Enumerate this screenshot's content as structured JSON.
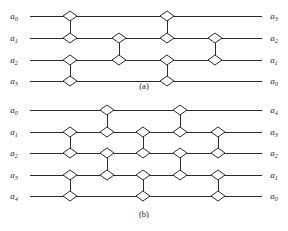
{
  "figure": {
    "background_color": "#ffffff",
    "line_color": "#2b2b2b",
    "node_fill_color": "#ffffff",
    "panels": [
      {
        "id": "a",
        "caption": "(a)",
        "caption_x": 144,
        "caption_y": 89,
        "wire_x_start": 30,
        "wire_x_end": 262,
        "label_left_x": 14,
        "label_right_x": 274,
        "wires": [
          {
            "y": 16,
            "input_base": "a",
            "input_sub": "0",
            "output_base": "a",
            "output_sub": "3"
          },
          {
            "y": 38,
            "input_base": "a",
            "input_sub": "1",
            "output_base": "a",
            "output_sub": "2"
          },
          {
            "y": 60,
            "input_base": "a",
            "input_sub": "2",
            "output_base": "a",
            "output_sub": "1"
          },
          {
            "y": 81,
            "input_base": "a",
            "input_sub": "3",
            "output_base": "a",
            "output_sub": "0"
          }
        ],
        "comparators": [
          {
            "x": 70,
            "top_wire": 0,
            "bottom_wire": 1
          },
          {
            "x": 70,
            "top_wire": 2,
            "bottom_wire": 3
          },
          {
            "x": 119,
            "top_wire": 1,
            "bottom_wire": 2
          },
          {
            "x": 167,
            "top_wire": 0,
            "bottom_wire": 1
          },
          {
            "x": 167,
            "top_wire": 2,
            "bottom_wire": 3
          },
          {
            "x": 215,
            "top_wire": 1,
            "bottom_wire": 2
          }
        ]
      },
      {
        "id": "b",
        "caption": "(b)",
        "caption_x": 144,
        "caption_y": 217,
        "wire_x_start": 30,
        "wire_x_end": 262,
        "label_left_x": 14,
        "label_right_x": 274,
        "wires": [
          {
            "y": 110,
            "input_base": "a",
            "input_sub": "0",
            "output_base": "a",
            "output_sub": "4"
          },
          {
            "y": 132,
            "input_base": "a",
            "input_sub": "1",
            "output_base": "a",
            "output_sub": "3"
          },
          {
            "y": 153,
            "input_base": "a",
            "input_sub": "2",
            "output_base": "a",
            "output_sub": "2"
          },
          {
            "y": 175,
            "input_base": "a",
            "input_sub": "3",
            "output_base": "a",
            "output_sub": "1"
          },
          {
            "y": 196,
            "input_base": "a",
            "input_sub": "4",
            "output_base": "a",
            "output_sub": "0"
          }
        ],
        "comparators": [
          {
            "x": 70,
            "top_wire": 1,
            "bottom_wire": 2
          },
          {
            "x": 70,
            "top_wire": 3,
            "bottom_wire": 4
          },
          {
            "x": 107,
            "top_wire": 0,
            "bottom_wire": 1
          },
          {
            "x": 107,
            "top_wire": 2,
            "bottom_wire": 3
          },
          {
            "x": 143,
            "top_wire": 1,
            "bottom_wire": 2
          },
          {
            "x": 143,
            "top_wire": 3,
            "bottom_wire": 4
          },
          {
            "x": 180,
            "top_wire": 0,
            "bottom_wire": 1
          },
          {
            "x": 180,
            "top_wire": 2,
            "bottom_wire": 3
          },
          {
            "x": 218,
            "top_wire": 1,
            "bottom_wire": 2
          },
          {
            "x": 218,
            "top_wire": 3,
            "bottom_wire": 4
          }
        ]
      }
    ],
    "node_shape": "diamond",
    "node_half_width": 7,
    "node_half_height": 5
  }
}
